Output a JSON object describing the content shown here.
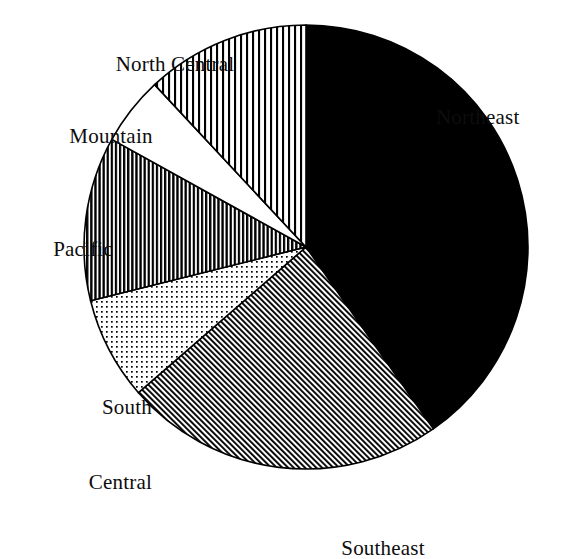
{
  "figure": {
    "background_color": "#ffffff",
    "ink_color": "#000000",
    "geometry": {
      "center_x": 306,
      "center_y": 247,
      "radius": 222
    }
  },
  "labels": {
    "north_central": "North Central",
    "mountain": "Mountain",
    "pacific": "Pacific",
    "south_central_line1": "South",
    "south_central_line2": "Central",
    "northeast": "Northeast",
    "southeast": "Southeast"
  },
  "chart_data": {
    "type": "pie",
    "title": "",
    "subtitle": "",
    "xlabel": "",
    "ylabel": "",
    "grid": false,
    "legend_position": "none",
    "label_placement": "outside-callout",
    "start_angle_deg": 0,
    "direction": "clockwise",
    "categories": [
      "Northeast",
      "Southeast",
      "South Central",
      "Pacific",
      "Mountain",
      "North Central"
    ],
    "values": [
      40.3,
      23.3,
      7.5,
      11.9,
      5.0,
      11.7
    ],
    "value_unit": "percent",
    "slices": [
      {
        "label": "Northeast",
        "value": 40.3,
        "start_angle_deg": 0,
        "end_angle_deg": 145,
        "sweep_deg": 145,
        "fill": "solid-black",
        "fill_color": "#000000",
        "label_side": "right"
      },
      {
        "label": "Southeast",
        "value": 23.3,
        "start_angle_deg": 145,
        "end_angle_deg": 229,
        "sweep_deg": 84,
        "fill": "diagonal-hatch-fine",
        "fill_color": "#6b6b6b",
        "label_side": "bottom"
      },
      {
        "label": "South Central",
        "value": 7.5,
        "start_angle_deg": 229,
        "end_angle_deg": 256,
        "sweep_deg": 27,
        "fill": "dotted-stipple",
        "fill_color": "#c9c9c9",
        "label_side": "left"
      },
      {
        "label": "Pacific",
        "value": 11.9,
        "start_angle_deg": 256,
        "end_angle_deg": 299,
        "sweep_deg": 43,
        "fill": "vertical-stripes-dense",
        "fill_color": "#3a3a3a",
        "label_side": "left"
      },
      {
        "label": "Mountain",
        "value": 5.0,
        "start_angle_deg": 299,
        "end_angle_deg": 317,
        "sweep_deg": 18,
        "fill": "none-white",
        "fill_color": "#ffffff",
        "label_side": "upper-left"
      },
      {
        "label": "North Central",
        "value": 11.7,
        "start_angle_deg": 317,
        "end_angle_deg": 360,
        "sweep_deg": 43,
        "fill": "vertical-stripes-wide",
        "fill_color": "#8a8a8a",
        "label_side": "top"
      }
    ]
  }
}
